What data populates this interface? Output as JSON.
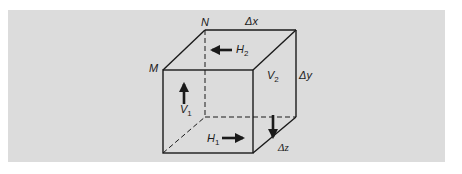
{
  "figure": {
    "colors": {
      "panel": "#dcdcdc",
      "lines": "#1a1a1a"
    },
    "vertices": {
      "M": "M",
      "N": "N"
    },
    "dimensions": {
      "dx": "Δx",
      "dy": "Δy",
      "dz": "Δz"
    },
    "flows": {
      "H1": {
        "base": "H",
        "sub": "1",
        "direction": "right"
      },
      "H2": {
        "base": "H",
        "sub": "2",
        "direction": "left"
      },
      "V1": {
        "base": "V",
        "sub": "1",
        "direction": "up"
      },
      "V2": {
        "base": "V",
        "sub": "2",
        "direction": "down"
      }
    }
  }
}
